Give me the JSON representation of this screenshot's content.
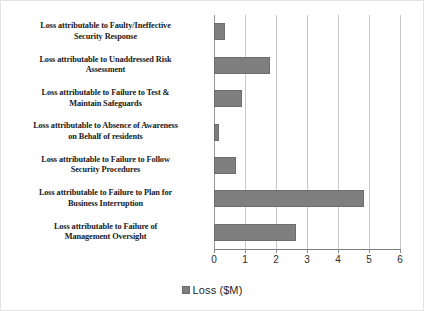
{
  "chart_data": {
    "type": "bar",
    "orientation": "horizontal",
    "title": "",
    "xlabel": "",
    "ylabel": "",
    "xlim": [
      0,
      6
    ],
    "xticks": [
      "0",
      "1",
      "2",
      "3",
      "4",
      "5",
      "6"
    ],
    "grid": true,
    "legend_position": "bottom",
    "legend": [
      "Loss ($M)"
    ],
    "series_name": "Loss ($M)",
    "bar_color": "#7f7f7f",
    "bar_border_color": "#6d6d6d",
    "gridline_color": "#c9c9c9",
    "axis_color": "#7d7d7d",
    "categories": [
      "Loss attributable to Faulty/Ineffective Security Response",
      "Loss attributable to Unaddressed Risk Assessment",
      "Loss attributable to Failure to Test & Maintain Safeguards",
      "Loss attributable to Absence of Awareness on Behalf of residents",
      "Loss attributable to Failure to Follow Security Procedures",
      "Loss attributable to Failure to Plan for Business Interruption",
      "Loss attributable to Failure of Management Oversight"
    ],
    "category_lines": [
      [
        "Loss attributable to Faulty/Ineffective",
        "Security Response"
      ],
      [
        "Loss attributable to Unaddressed Risk",
        "Assessment"
      ],
      [
        "Loss attributable to Failure to Test &",
        "Maintain Safeguards"
      ],
      [
        "Loss attributable to Absence of Awareness",
        "on Behalf of residents"
      ],
      [
        "Loss attributable to Failure to Follow",
        "Security Procedures"
      ],
      [
        "Loss attributable to Failure to Plan for",
        "Business Interruption"
      ],
      [
        "Loss attributable to Failure of",
        "Management Oversight"
      ]
    ],
    "values": [
      0.35,
      1.82,
      0.9,
      0.15,
      0.7,
      4.85,
      2.65
    ]
  }
}
